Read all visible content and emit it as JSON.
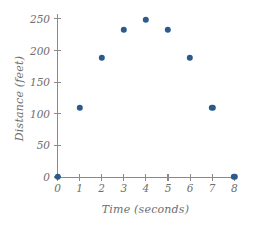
{
  "chart_data": {
    "type": "scatter",
    "title": "",
    "xlabel": "Time (seconds)",
    "ylabel": "Distance (feet)",
    "x": [
      0,
      1,
      2,
      3,
      4,
      5,
      6,
      7,
      8
    ],
    "values": [
      0,
      109,
      188,
      233,
      249,
      233,
      188,
      109,
      0
    ],
    "points": [
      {
        "x": 0,
        "y": 0
      },
      {
        "x": 1,
        "y": 109
      },
      {
        "x": 2,
        "y": 188
      },
      {
        "x": 3,
        "y": 233
      },
      {
        "x": 4,
        "y": 249
      },
      {
        "x": 5,
        "y": 233
      },
      {
        "x": 6,
        "y": 188
      },
      {
        "x": 7,
        "y": 109
      },
      {
        "x": 8,
        "y": 0
      }
    ],
    "xlim": [
      0,
      8
    ],
    "ylim": [
      0,
      262
    ],
    "xticks": [
      0,
      1,
      2,
      3,
      4,
      5,
      6,
      7,
      8
    ],
    "xtick_labels": [
      "0",
      "1",
      "2",
      "3",
      "4",
      "5",
      "6",
      "7",
      "8"
    ],
    "yticks": [
      0,
      50,
      100,
      150,
      200,
      250
    ],
    "ytick_labels": [
      "0",
      "50",
      "100",
      "150",
      "200",
      "250"
    ],
    "grid": false,
    "legend": null,
    "marker_color": "#2b5b8c",
    "axis_color": "#8a8a8a",
    "text_color": "#6e6e6e"
  }
}
